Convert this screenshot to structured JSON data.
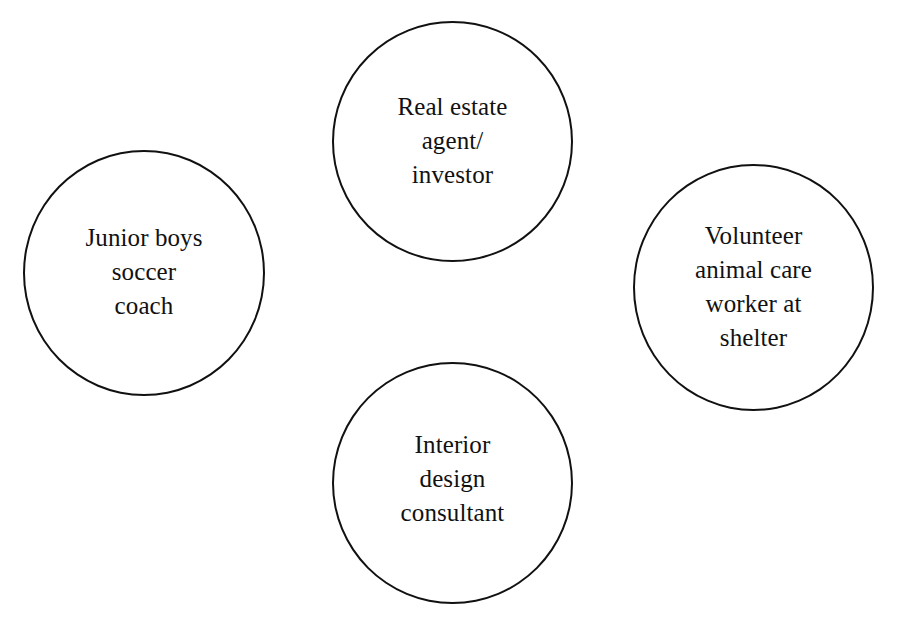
{
  "diagram": {
    "type": "circle-cluster",
    "nodes": [
      {
        "id": "top",
        "label": "Real estate\nagent/\ninvestor",
        "lines": [
          "Real estate",
          "agent/",
          "investor"
        ]
      },
      {
        "id": "left",
        "label": "Junior boys\nsoccer\ncoach",
        "lines": [
          "Junior boys",
          "soccer",
          "coach"
        ]
      },
      {
        "id": "right",
        "label": "Volunteer\nanimal care\nworker at\nshelter",
        "lines": [
          "Volunteer",
          "animal care",
          "worker at",
          "shelter"
        ]
      },
      {
        "id": "bottom",
        "label": "Interior\ndesign\nconsultant",
        "lines": [
          "Interior",
          "design",
          "consultant"
        ]
      }
    ],
    "colors": {
      "background": "#ffffff",
      "stroke": "#111111",
      "text": "#111111"
    }
  }
}
